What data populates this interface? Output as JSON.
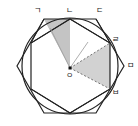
{
  "diagram": {
    "type": "geometry",
    "center_label": "ㅇ",
    "point_labels": {
      "g": "ㄱ",
      "n": "ㄴ",
      "d": "ㄷ",
      "r": "ㄹ",
      "m": "ㅁ",
      "b": "ㅂ"
    },
    "colors": {
      "stroke": "#222222",
      "shade": "#c8c8c8",
      "shade_light": "#dddddd"
    }
  }
}
